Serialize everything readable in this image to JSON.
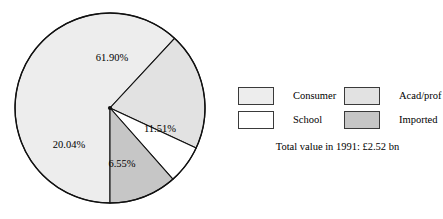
{
  "chart_data": {
    "type": "pie",
    "title": "",
    "labels": [
      "Consumer",
      "Acad/prof",
      "School",
      "Imported"
    ],
    "values": [
      61.9,
      20.04,
      6.55,
      11.51
    ],
    "value_labels": [
      "61.90%",
      "20.04%",
      "6.55%",
      "11.51%"
    ],
    "colors": [
      "#ededed",
      "#e2e2e2",
      "#ffffff",
      "#c6c6c6"
    ],
    "units": "percent",
    "legend_position": "right",
    "grid": false,
    "annotations": [
      "Total value in 1991: £2.52 bn"
    ]
  },
  "pie": {
    "slices": [
      {
        "name": "Consumer",
        "percent_label": "61.90%",
        "value": 61.9,
        "color": "#ededed"
      },
      {
        "name": "Acad/prof",
        "percent_label": "20.04%",
        "value": 20.04,
        "color": "#e2e2e2"
      },
      {
        "name": "School",
        "percent_label": "6.55%",
        "value": 6.55,
        "color": "#ffffff"
      },
      {
        "name": "Imported",
        "percent_label": "11.51%",
        "value": 11.51,
        "color": "#c6c6c6"
      }
    ],
    "outline_color": "#111111"
  },
  "legend": {
    "entries": [
      {
        "label": "Consumer",
        "color": "#ededed"
      },
      {
        "label": "Acad/prof",
        "color": "#e2e2e2"
      },
      {
        "label": "School",
        "color": "#ffffff"
      },
      {
        "label": "Imported",
        "color": "#c6c6c6"
      }
    ],
    "footnote": "Total value in 1991: £2.52 bn"
  }
}
